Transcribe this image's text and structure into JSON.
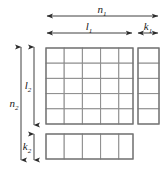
{
  "figure": {
    "type": "block-matrix-partition-diagram",
    "background_color": "#ffffff",
    "grid_line_color": "#8d8d8d",
    "block_outline_color": "#707070",
    "arrow_color": "#2b2b2b",
    "label_color": "#1a1a1a"
  },
  "labels": {
    "n1": {
      "base": "n",
      "sub": "1",
      "full": "n₁"
    },
    "l1": {
      "base": "l",
      "sub": "1",
      "full": "l₁"
    },
    "k1": {
      "base": "k",
      "sub": "1",
      "full": "k₁"
    },
    "n2": {
      "base": "n",
      "sub": "2",
      "full": "n₂"
    },
    "l2": {
      "base": "l",
      "sub": "2",
      "full": "l₂"
    },
    "k2": {
      "base": "k",
      "sub": "2",
      "full": "k₂"
    }
  },
  "blocks": {
    "main": {
      "name": "main-block",
      "columns": 5,
      "rows": 5
    },
    "right": {
      "name": "right-block",
      "columns": 1,
      "rows": 5
    },
    "bottom": {
      "name": "bottom-block",
      "columns": 5,
      "rows": 1
    }
  },
  "dimensions": {
    "horizontal": [
      {
        "name": "n1",
        "label": "n₁",
        "spans": "full-width"
      },
      {
        "name": "l1",
        "label": "l₁",
        "spans": "main-block-width"
      },
      {
        "name": "k1",
        "label": "k₁",
        "spans": "right-block-width"
      }
    ],
    "vertical": [
      {
        "name": "n2",
        "label": "n₂",
        "spans": "full-height"
      },
      {
        "name": "l2",
        "label": "l₂",
        "spans": "main-block-height"
      },
      {
        "name": "k2",
        "label": "k₂",
        "spans": "bottom-block-height"
      }
    ]
  }
}
